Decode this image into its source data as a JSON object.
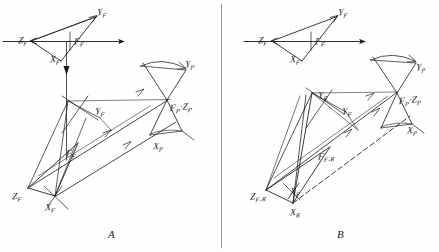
{
  "figure": {
    "type": "engineering-line-drawing",
    "background_color": "#fefefe",
    "ink_color": "#1a1a1a"
  },
  "panels": [
    {
      "id": "A",
      "letter": "A",
      "letter_pos": {
        "x": 108,
        "y": 228
      },
      "labels": [
        {
          "name": "label-zf-top",
          "base": "Z",
          "sub": "F",
          "x": 18,
          "y": 36
        },
        {
          "name": "label-yf-top",
          "base": "Y",
          "sub": "F",
          "x": 97,
          "y": 8
        },
        {
          "name": "label-xf-top",
          "base": "X",
          "sub": "F",
          "x": 50,
          "y": 55
        },
        {
          "name": "label-ff-top",
          "base": "F",
          "sub": "F",
          "x": 74,
          "y": 37
        },
        {
          "name": "label-yp",
          "base": "Y",
          "sub": "P",
          "x": 185,
          "y": 60
        },
        {
          "name": "label-yf-mid",
          "base": "Y",
          "sub": "F",
          "x": 95,
          "y": 107
        },
        {
          "name": "label-fpzp",
          "base": "F",
          "sub": "P",
          "sep": "·",
          "base2": "Z",
          "sub2": "P",
          "x": 170,
          "y": 103
        },
        {
          "name": "label-xp",
          "base": "X",
          "sub": "P",
          "x": 153,
          "y": 142
        },
        {
          "name": "label-ff-mid",
          "base": "F",
          "sub": "F",
          "x": 66,
          "y": 149
        },
        {
          "name": "label-zf-bot",
          "base": "Z",
          "sub": "F",
          "x": 12,
          "y": 192
        },
        {
          "name": "label-xf-bot",
          "base": "X",
          "sub": "F",
          "x": 45,
          "y": 203
        }
      ]
    },
    {
      "id": "B",
      "letter": "B",
      "letter_pos": {
        "x": 337,
        "y": 228
      },
      "labels": [
        {
          "name": "label-zf-top-b",
          "base": "Z",
          "sub": "F",
          "x": 258,
          "y": 36
        },
        {
          "name": "label-yf-top-b",
          "base": "Y",
          "sub": "F",
          "x": 338,
          "y": 8
        },
        {
          "name": "label-xf-top-b",
          "base": "X",
          "sub": "F",
          "x": 290,
          "y": 55
        },
        {
          "name": "label-ff-top-b",
          "base": "F",
          "sub": "F",
          "x": 315,
          "y": 37
        },
        {
          "name": "label-yp-b",
          "base": "Y",
          "sub": "P",
          "x": 416,
          "y": 63
        },
        {
          "name": "label-yr-b",
          "base": "Y",
          "sub": "R",
          "x": 318,
          "y": 91
        },
        {
          "name": "label-yf-mid-b",
          "base": "Y",
          "sub": "F",
          "x": 342,
          "y": 107
        },
        {
          "name": "label-fpzp-b",
          "base": "F",
          "sub": "P",
          "sep": "·",
          "base2": "Z",
          "sub2": "P",
          "x": 399,
          "y": 96
        },
        {
          "name": "label-xp-b",
          "base": "X",
          "sub": "P",
          "x": 407,
          "y": 126
        },
        {
          "name": "label-ffr-b",
          "base": "F",
          "sub": "F-R",
          "x": 318,
          "y": 152
        },
        {
          "name": "label-xf-b",
          "base": "X",
          "sub": "F",
          "x": 290,
          "y": 187
        },
        {
          "name": "label-zfr-b",
          "base": "Z",
          "sub": "F-R",
          "x": 250,
          "y": 192
        },
        {
          "name": "label-xr-b",
          "base": "X",
          "sub": "R",
          "x": 290,
          "y": 208
        }
      ]
    }
  ],
  "geometry": {
    "panel_a": {
      "ground_line": {
        "x1": 2,
        "y1": 41,
        "x2": 126,
        "y2": 41,
        "arrow": true
      },
      "top_triangle": {
        "z": [
          31,
          41
        ],
        "y": [
          96,
          16
        ],
        "x": [
          61,
          62
        ],
        "f": [
          70,
          41
        ]
      },
      "vertical_axis": {
        "x": 66,
        "y1": 41,
        "y2": 160,
        "arrow_y": 72
      },
      "lower_frame": {
        "zf": [
          28,
          188
        ],
        "xf": [
          55,
          196
        ],
        "ff": [
          78,
          143
        ],
        "apex": [
          68,
          100
        ],
        "p_origin": [
          167,
          99
        ],
        "yp": [
          182,
          68
        ],
        "xp": [
          142,
          139
        ]
      }
    },
    "panel_b": {
      "ground_line": {
        "x1": 243,
        "y1": 41,
        "x2": 366,
        "y2": 41,
        "arrow": true
      },
      "top_triangle": {
        "z": [
          271,
          41
        ],
        "y": [
          337,
          16
        ],
        "x": [
          301,
          62
        ],
        "f": [
          311,
          41
        ]
      },
      "lower_frame": {
        "zfr": [
          266,
          190
        ],
        "xr": [
          293,
          203
        ],
        "ffr": [
          330,
          147
        ],
        "apex": [
          312,
          92
        ],
        "p_origin": [
          396,
          93
        ],
        "yp": [
          412,
          62
        ],
        "xp": [
          400,
          123
        ]
      }
    }
  },
  "divider": {
    "name": "panel-divider",
    "x": 221,
    "y1": 4,
    "y2": 248
  }
}
